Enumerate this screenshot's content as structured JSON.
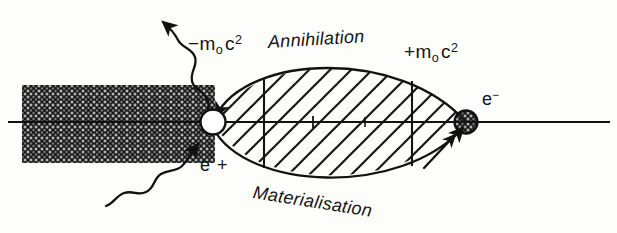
{
  "figure": {
    "ink_color": "#111111",
    "background_color": "#fdfdfc"
  },
  "labels": {
    "negative_rest_energy": {
      "sign": "−",
      "symbol": "m",
      "subscript": "o",
      "unit": "c",
      "exponent": "2"
    },
    "positive_rest_energy": {
      "sign": "+",
      "symbol": "m",
      "subscript": "o",
      "unit": "c",
      "exponent": "2"
    },
    "annihilation": "Annihilation",
    "materialisation": "Materialisation",
    "positron": "e +",
    "electron": {
      "symbol": "e",
      "charge": "−"
    }
  },
  "elements": {
    "axis_label": "energy-axis",
    "negative_sea_label": "filled-negative-energy-sea",
    "forbidden_gap_label": "forbidden-energy-gap",
    "positron_marker_label": "positron-hole",
    "electron_marker_label": "electron-particle",
    "photon_out_label": "emitted-photon",
    "photon_in_label": "incident-photon"
  },
  "geometry": {
    "axis_y": 122,
    "axis_x_start": 8,
    "axis_x_end": 610,
    "hatch_region": {
      "x": 22,
      "y": 85,
      "width": 193,
      "height": 78
    },
    "lens": {
      "x_left": 215,
      "x_right": 466,
      "y_top": 62,
      "y_bottom": 188
    },
    "positron_circle": {
      "cx": 213,
      "cy": 122,
      "r": 12
    },
    "electron_circle": {
      "cx": 466,
      "cy": 122,
      "r": 11
    },
    "vertical_ticks": [
      264,
      412
    ]
  }
}
